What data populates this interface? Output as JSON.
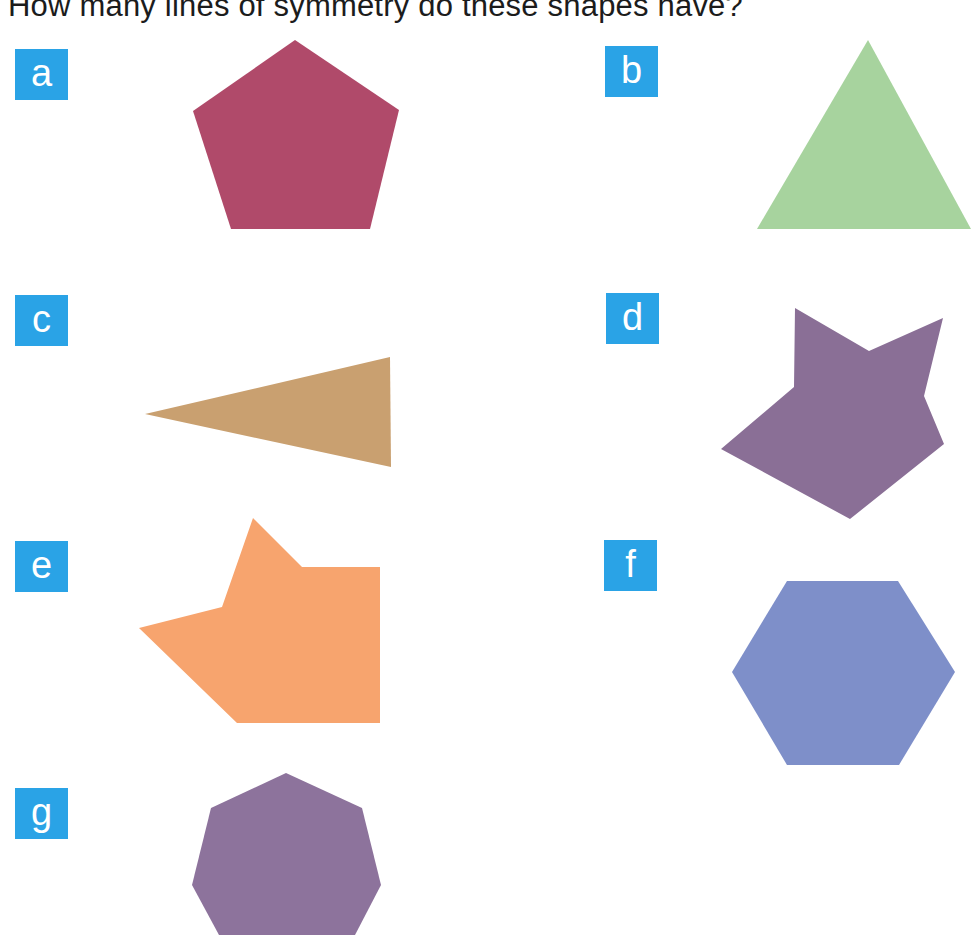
{
  "question": "How many lines of symmetry do these shapes have?",
  "items": [
    {
      "label": "a",
      "shape": "regular-pentagon",
      "color": "#b04a6a"
    },
    {
      "label": "b",
      "shape": "equilateral-triangle",
      "color": "#a7d39e"
    },
    {
      "label": "c",
      "shape": "isosceles-triangle",
      "color": "#c9a070"
    },
    {
      "label": "d",
      "shape": "irregular-star-polygon",
      "color": "#8a6f96"
    },
    {
      "label": "e",
      "shape": "irregular-arrow-polygon",
      "color": "#f7a46e"
    },
    {
      "label": "f",
      "shape": "regular-hexagon",
      "color": "#7e8fc9"
    },
    {
      "label": "g",
      "shape": "regular-heptagon",
      "color": "#8d739c"
    }
  ],
  "badge_color": "#2aa3e6"
}
